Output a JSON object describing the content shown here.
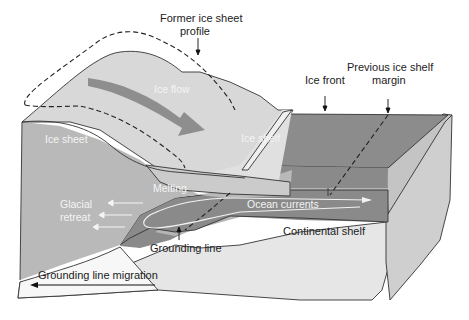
{
  "diagram": {
    "colors": {
      "background": "#ffffff",
      "ice_surface": "#d6d6d6",
      "ice_sheet_side": "#bdbdbd",
      "ice_shelf_top": "#e2e2e2",
      "ocean_top": "#8a8a8a",
      "ocean_water": "#7a7a7a",
      "continental_shelf": "#dcdcdc",
      "bedrock_front": "#ececec",
      "flow_arrow": "#8f8f8f",
      "outline": "#333333"
    },
    "labels": {
      "former_profile_line1": "Former ice sheet",
      "former_profile_line2": "profile",
      "ice_flow": "Ice flow",
      "ice_sheet": "Ice sheet",
      "ice_shelf": "Ice shelf",
      "ice_front": "Ice front",
      "previous_margin_line1": "Previous ice shelf",
      "previous_margin_line2": "margin",
      "melting": "Melting",
      "glacial_retreat_line1": "Glacial",
      "glacial_retreat_line2": "retreat",
      "ocean_currents": "Ocean currents",
      "grounding_line": "Grounding line",
      "continental_shelf": "Continental shelf",
      "grounding_line_migration": "Grounding line migration"
    }
  }
}
